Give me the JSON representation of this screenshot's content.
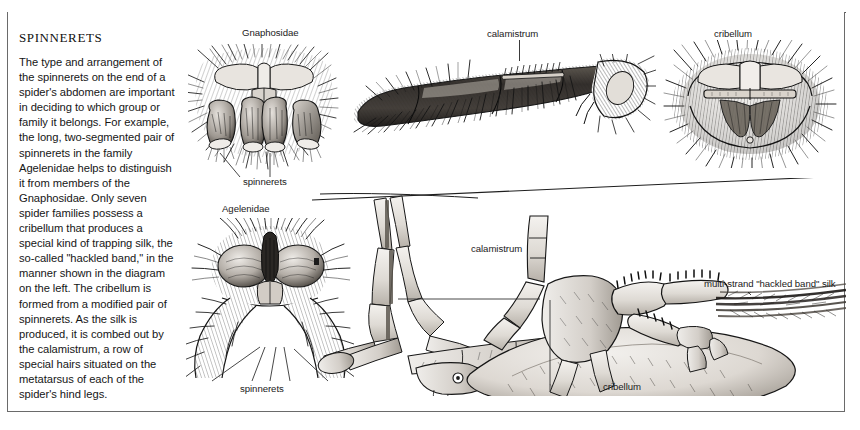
{
  "plate": {
    "title": "Spinnerets",
    "body": "The type and arrangement of the spinnerets on the end of a spider's abdomen are important in deciding to which group or family it belongs. For example, the long, two-segmented pair of spinnerets in the family Agelenidae helps to distinguish it from members of the Gnaphosidae. Only seven spider families possess a cribellum that produces a special kind of trapping silk, the so-called \"hackled band,\" in the manner shown in the diagram on the left. The cribellum is formed from a modified pair of spinnerets. As the silk is produced, it is combed out by the calamistrum, a row of special hairs situated on the metatarsus of each of the spider's hind legs.",
    "background_color": "#ffffff",
    "ink_color": "#161616",
    "frame_color": "#6a6a6a"
  },
  "figures": {
    "gnaphosidae": {
      "caption": "Gnaphosidae",
      "callout": "spinnerets",
      "description": "ventral view of a gnaphosid spider abdomen tip showing four cylindrical spinnerets surrounded by dense hair"
    },
    "agelenidae": {
      "caption": "Agelenidae",
      "callout": "spinnerets",
      "description": "ventral view of an agelenid spider abdomen tip showing long two-segmented posterior spinnerets"
    },
    "calamistrum_leg": {
      "caption": "calamistrum",
      "description": "detail of a spider hind leg metatarsus bearing the calamistrum, a comb row of curved hairs"
    },
    "cribellum_plate": {
      "caption": "cribellum",
      "description": "detail of the cribellum, a flat perforated silk-spinning plate in front of the spinnerets"
    },
    "combing_diagram": {
      "callout_calamistrum": "calamistrum",
      "callout_cribellum": "cribellum",
      "callout_silk": "multi-strand \"hackled band\" silk",
      "description": "line drawing of a cribellate spider drawing its hind leg calamistrum across the cribellum to comb out hackled band silk"
    }
  }
}
